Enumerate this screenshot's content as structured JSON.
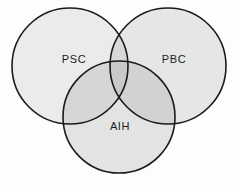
{
  "figure": {
    "type": "venn-diagram",
    "background_color": "#fdfdfd",
    "outline_color": "#1a1a1a",
    "fill_color": "#e9e9e9",
    "overlap_fill_color": "#d4d4d4",
    "triple_overlap_fill_color": "#c4c4c4"
  },
  "chart_data": {
    "type": "venn",
    "title": "",
    "sets": [
      {
        "id": "psc",
        "label": "PSC",
        "position": "top-left",
        "cx": 70,
        "cy": 66,
        "r": 58,
        "label_x": 74,
        "label_y": 60,
        "fill": "#ebebeb"
      },
      {
        "id": "pbc",
        "label": "PBC",
        "position": "top-right",
        "cx": 168,
        "cy": 66,
        "r": 58,
        "label_x": 174,
        "label_y": 60,
        "fill": "#e6e6e6"
      },
      {
        "id": "aih",
        "label": "AIH",
        "position": "bottom-center",
        "cx": 119,
        "cy": 117,
        "r": 56,
        "label_x": 120,
        "label_y": 127,
        "fill": "#e3e3e3"
      }
    ],
    "overlaps": [
      {
        "id": "psc-aih",
        "sets": [
          "PSC",
          "AIH"
        ],
        "label": ""
      },
      {
        "id": "pbc-aih",
        "sets": [
          "PBC",
          "AIH"
        ],
        "label": ""
      },
      {
        "id": "psc-pbc",
        "sets": [
          "PSC",
          "PBC"
        ],
        "label": ""
      }
    ],
    "legend": [],
    "xlabel": "",
    "ylabel": ""
  }
}
